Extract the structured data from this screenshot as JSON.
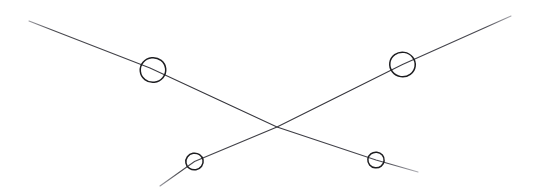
{
  "canvas": {
    "width": 537,
    "height": 190,
    "background_color": "#ffffff",
    "medium": "pencil-sketch-scan",
    "description": "Hand-drawn sketch of two crossing straight lines forming an X, with four hand-drawn open circles placed on the line arms"
  },
  "style": {
    "line_color": "#3a3a3f",
    "line_color_faint": "#8d8d93",
    "circle_color": "#1d1d20",
    "line_width": 1.1,
    "circle_width": 1.5
  },
  "chart_data": {
    "type": "diagram",
    "title": "",
    "xlabel": "",
    "ylabel": "",
    "xlim": [
      0,
      537
    ],
    "ylim": [
      0,
      190
    ],
    "grid": false,
    "legend": false,
    "series": [
      {
        "name": "descending-line",
        "type": "line",
        "x1": 29,
        "y1": 21,
        "x2": 418,
        "y2": 172,
        "slope": 0.388,
        "direction": "top-left to bottom-right"
      },
      {
        "name": "ascending-line",
        "type": "line",
        "x1": 160,
        "y1": 186,
        "x2": 511,
        "y2": 16,
        "slope": -0.484,
        "direction": "bottom-left to top-right"
      }
    ],
    "markers": [
      {
        "name": "large-circle-upper-left",
        "cx": 153,
        "cy": 70,
        "r": 12.5,
        "size": "large",
        "on_line": "descending-line"
      },
      {
        "name": "large-circle-upper-right",
        "cx": 402.5,
        "cy": 64.5,
        "r": 12.5,
        "size": "large",
        "on_line": "ascending-line"
      },
      {
        "name": "small-circle-lower-left",
        "cx": 194.5,
        "cy": 161.5,
        "r": 8.5,
        "size": "small",
        "on_line": "ascending-line"
      },
      {
        "name": "small-circle-lower-right",
        "cx": 376,
        "cy": 160,
        "r": 8,
        "size": "small",
        "on_line": "descending-line"
      }
    ],
    "annotations": [
      {
        "name": "intersection-point",
        "x": 277,
        "y": 127,
        "label": ""
      }
    ]
  }
}
